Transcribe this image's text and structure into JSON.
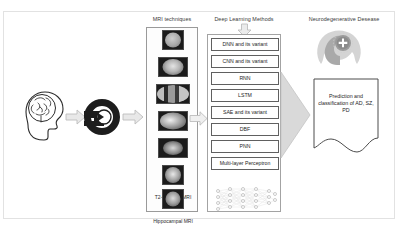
{
  "figure": {
    "titles": {
      "mri": "MRI techniques",
      "deep_learning": "Deep Learning Methods",
      "disease": "Neurodegenerative Desease"
    }
  },
  "left_stage": {
    "brain_head_icon": "head-with-brain-icon",
    "scanner_icon": "mri-scanner-icon"
  },
  "mri_techniques": {
    "items": [
      {
        "label": "f-MRI",
        "thumb": "fmri-axial-scan"
      },
      {
        "label": "s-MRI",
        "thumb": "smri-axial-scan"
      },
      {
        "label": "rs-MRI",
        "thumb": "rsmri-multi-panel-scan"
      },
      {
        "label": "3D-MRI",
        "thumb": "3dmri-sagittal-scan"
      },
      {
        "label": "4D-MRI",
        "thumb": "4dmri-scan"
      },
      {
        "label": "T2-weightedMRI",
        "thumb": "t2-weighted-scan"
      },
      {
        "label": "Hippocampal MRI",
        "thumb": "hippocampal-scan"
      }
    ]
  },
  "deep_learning": {
    "methods": [
      "DNN and its variant",
      "CNN and its variant",
      "RNN",
      "LSTM",
      "SAE and its variant",
      "DBF",
      "PNN",
      "Multi-layer Perceptron"
    ],
    "network_diagram": "neural-network-nodes-diagram"
  },
  "disease_stage": {
    "icon": "head-with-medical-cross-icon",
    "prediction_text": "Prediction and classification of AD, SZ, PD"
  },
  "flow_arrows": {
    "brain_to_scanner": "arrow-right",
    "scanner_to_mri": "arrow-right",
    "mri_to_deep_learning": "arrow-right",
    "title_to_deep_learning": "arrow-down",
    "deep_learning_to_disease": "arrow-right-large"
  },
  "colors": {
    "arrow_fill": "#e8e8e8",
    "arrow_stroke": "#b9b9b9",
    "big_arrow_fill": "#d9d9d9",
    "panel_border": "#9a9a9a",
    "text": "#2a2a2a"
  }
}
